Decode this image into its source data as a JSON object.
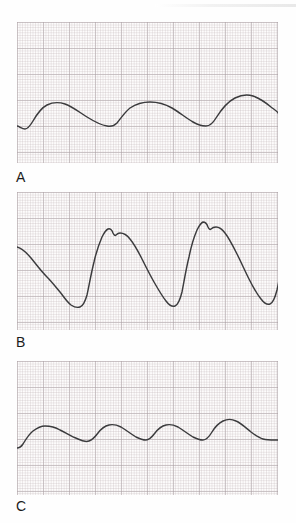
{
  "figure": {
    "type": "medical-waveform-figure",
    "background_color": "#fefefe",
    "grid_color": "#bcb2b4",
    "grid_bold_color": "#968c91",
    "trace_color": "#3b3b3d",
    "panels": [
      {
        "id": "panel-a",
        "label": "A",
        "name": "waveform-panel-a",
        "description": "Low-amplitude damped undulating pressure tracing with three broad rounded waves",
        "cycles": 3,
        "path": "M0,104 C2,104 5,107 8,107 C11,107 13,104 16,99 C20,92 24,86 30,83 C36,80 42,80 48,82 C56,85 62,90 70,95 C78,100 84,103 90,104 C94,105 97,104 100,101 C104,96 108,90 113,86 C119,82 126,80 133,80 C141,80 148,82 155,86 C162,90 169,96 176,100 C181,103 185,104 189,104 C193,104 196,101 199,96 C204,88 210,80 218,76 C224,73 230,72 236,74 C242,76 248,80 254,85 C258,88 261,90 261,91"
      },
      {
        "id": "panel-b",
        "label": "B",
        "name": "waveform-panel-b",
        "description": "High-amplitude arterial pressure tracing with steep upstrokes, notched systolic peaks and slow downslopes; three complete beats",
        "cycles": 3,
        "path": "M0,55 C4,56 9,60 14,66 C19,72 24,79 30,85 C34,89 38,94 43,100 C47,105 50,110 54,113 C57,115 60,116 63,115 C66,114 68,110 70,103 C72,94 74,82 77,70 C79,61 82,52 85,45 C87,41 89,38 91,37 C93,36 95,38 96,41 C97,43 98,44 99,43 C100,42 101,41 103,41 C106,41 110,43 113,47 C117,52 121,59 125,67 C129,75 133,83 137,90 C141,97 145,104 149,109 C152,113 155,115 158,114 C161,113 163,108 165,100 C167,90 169,77 172,65 C174,55 177,45 180,38 C182,34 184,31 186,30 C188,30 190,32 191,35 C192,37 193,38 194,37 C195,36 197,35 199,35 C202,35 205,37 208,41 C212,46 216,54 220,62 C224,70 228,79 232,87 C236,95 240,102 244,107 C247,111 250,113 253,112 C256,111 258,106 260,98 C262,89 264,77 267,66 C269,56 272,47 275,41 C277,37 279,35 281,35 C283,35 285,38 286,42 C287,44 288,45 289,44 C290,43 292,43 295,43 C298,44 301,47 304,52"
      },
      {
        "id": "panel-c",
        "label": "C",
        "name": "waveform-panel-c",
        "description": "Low-amplitude near-sinusoidal venous pressure tracing with four gentle rounded waves",
        "cycles": 4,
        "path": "M0,87 C2,87 4,86 6,83 C9,78 12,73 16,70 C20,67 24,65 28,65 C33,65 38,66 43,69 C49,72 55,76 61,78 C65,80 69,81 72,80 C75,79 78,76 81,72 C84,68 88,65 92,64 C96,63 100,64 104,66 C109,69 114,73 119,76 C123,78 126,79 129,79 C132,79 135,76 138,72 C141,68 145,65 149,64 C153,63 157,64 161,66 C166,69 171,73 176,76 C180,78 183,79 186,79 C189,79 192,76 195,71 C198,66 202,62 206,60 C210,58 215,58 219,60 C224,62 229,67 234,71 C238,74 242,77 246,78 C250,79 254,79 258,79 C260,79 261,79 261,79"
      }
    ]
  }
}
